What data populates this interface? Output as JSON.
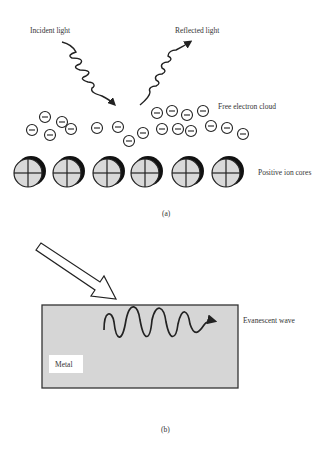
{
  "panel_a": {
    "incident_label": "Incident light",
    "reflected_label": "Reflected light",
    "electron_label": "Free electron cloud",
    "ion_label": "Positive ion cores",
    "caption": "(a)",
    "electron_symbol": "−",
    "ion_symbol": "+",
    "ion_count": 6,
    "electron_count": 22
  },
  "panel_b": {
    "wave_label": "Evanescent wave",
    "metal_label": "Metal",
    "caption": "(b)"
  },
  "colors": {
    "metal_fill": "#d6d6d6",
    "ion_fill": "#d9d9d9",
    "stroke": "#222222"
  }
}
